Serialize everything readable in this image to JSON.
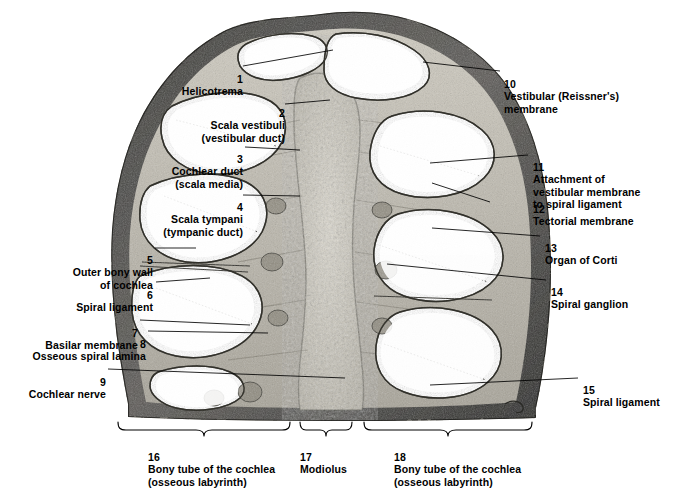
{
  "figure": {
    "background_color": "#ffffff",
    "text_color": "#000000",
    "leader_line_color": "#000000"
  },
  "labels": {
    "left": [
      {
        "num": "1",
        "text": "Helicotrema"
      },
      {
        "num": "2",
        "text": "Scala vestibuli\n(vestibular duct)"
      },
      {
        "num": "3",
        "text": "Cochlear duct\n(scala media)"
      },
      {
        "num": "4",
        "text": "Scala tympani\n(tympanic duct)"
      },
      {
        "num": "5",
        "text": "Outer bony wall\nof cochlea"
      },
      {
        "num": "6",
        "text": "Spiral ligament"
      },
      {
        "num": "7",
        "text": "Basilar membrane"
      },
      {
        "num": "8",
        "text": "Osseous spiral lamina"
      },
      {
        "num": "9",
        "text": "Cochlear nerve"
      }
    ],
    "right": [
      {
        "num": "10",
        "text": "Vestibular (Reissner's) membrane"
      },
      {
        "num": "11",
        "text": "Attachment of\nvestibular membrane\nto spiral ligament"
      },
      {
        "num": "12",
        "text": "Tectorial membrane"
      },
      {
        "num": "13",
        "text": "Organ of Corti"
      },
      {
        "num": "14",
        "text": "Spiral ganglion"
      },
      {
        "num": "15",
        "text": "Spiral ligament"
      }
    ],
    "bottom": [
      {
        "num": "16",
        "text": "Bony tube of the cochlea\n(osseous labyrinth)"
      },
      {
        "num": "17",
        "text": "Modiolus"
      },
      {
        "num": "18",
        "text": "Bony tube of the cochlea\n(osseous labyrinth)"
      }
    ]
  }
}
